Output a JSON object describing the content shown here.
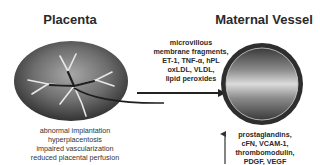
{
  "placenta": {
    "title": "Placenta",
    "causes": [
      "abnormal implantation",
      "hyperplacentosis",
      "impaired vascularization",
      "reduced placental perfusion"
    ]
  },
  "maternal_vessel": {
    "title": "Maternal Vessel",
    "factors": [
      "prostaglandins,",
      "cFN, VCAM-1,",
      "thrombomodulin,",
      "PDGF, VEGF"
    ]
  },
  "mediators": {
    "lines": [
      "microvillous",
      "membrane fragments,",
      "ET-1, TNF-α, hPL",
      "oxLDL, VLDL,",
      "lipid peroxides"
    ]
  },
  "colors": {
    "ellipse_dark": "#3a3a3a",
    "ellipse_light": "#9a9a9a",
    "vessel_ring": "#2e2e2e",
    "vessel_light": "#d8d8d8",
    "arrow": "#222222"
  }
}
